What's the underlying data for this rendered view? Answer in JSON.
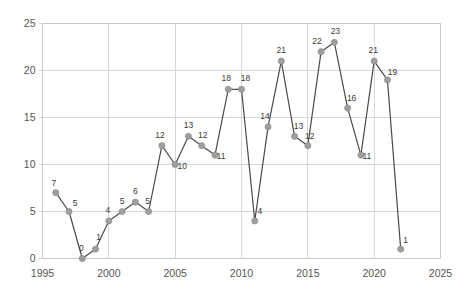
{
  "chart_data": {
    "type": "line",
    "title": "",
    "subtitle": "",
    "xlabel": "",
    "ylabel": "",
    "x": [
      1996,
      1997,
      1998,
      1999,
      2000,
      2001,
      2002,
      2003,
      2004,
      2005,
      2006,
      2007,
      2008,
      2009,
      2010,
      2011,
      2012,
      2013,
      2014,
      2015,
      2016,
      2017,
      2018,
      2019,
      2020,
      2021,
      2022
    ],
    "values": [
      7,
      5,
      0,
      1,
      4,
      5,
      6,
      5,
      12,
      10,
      13,
      12,
      11,
      18,
      18,
      4,
      14,
      21,
      13,
      12,
      22,
      23,
      16,
      11,
      21,
      19,
      1
    ],
    "point_labels": [
      "7",
      "5",
      "0",
      "1",
      "4",
      "5",
      "6",
      "5",
      "12",
      "10",
      "13",
      "12",
      "11",
      "18",
      "18",
      "4",
      "14",
      "21",
      "13",
      "12",
      "22",
      "23",
      "16",
      "11",
      "21",
      "19",
      "1"
    ],
    "xlim": [
      1995,
      2025
    ],
    "ylim": [
      0,
      25
    ],
    "xticks": [
      1995,
      2000,
      2005,
      2010,
      2015,
      2020,
      2025
    ],
    "xtick_labels": [
      "1995",
      "2000",
      "2005",
      "2010",
      "2015",
      "2020",
      "2025"
    ],
    "yticks": [
      0,
      5,
      10,
      15,
      20,
      25
    ],
    "ytick_labels": [
      "0",
      "5",
      "10",
      "15",
      "20",
      "25"
    ],
    "grid": true,
    "legend": null,
    "legend_position": "none",
    "series_name": "",
    "colors": {
      "line": "#4a4a4a",
      "marker": "#9e9e9e",
      "grid": "#d8d8d8",
      "border": "#c9c9c9",
      "tick_text": "#555555",
      "label_text": "#3a3a3a",
      "background": "#ffffff"
    },
    "label_offsets": [
      {
        "dx": -2,
        "dy": -7
      },
      {
        "dx": 6,
        "dy": -6
      },
      {
        "dx": -1,
        "dy": -8
      },
      {
        "dx": 3,
        "dy": -9
      },
      {
        "dx": -1,
        "dy": -8
      },
      {
        "dx": 0,
        "dy": -8
      },
      {
        "dx": 0,
        "dy": -8
      },
      {
        "dx": -1,
        "dy": -8
      },
      {
        "dx": -2,
        "dy": -8
      },
      {
        "dx": 7,
        "dy": 4
      },
      {
        "dx": 0,
        "dy": -8
      },
      {
        "dx": 1,
        "dy": -8
      },
      {
        "dx": 6,
        "dy": 4
      },
      {
        "dx": -2,
        "dy": -8
      },
      {
        "dx": 4,
        "dy": -8
      },
      {
        "dx": 5,
        "dy": -7
      },
      {
        "dx": -3,
        "dy": -8
      },
      {
        "dx": 0,
        "dy": -8
      },
      {
        "dx": 4,
        "dy": -7
      },
      {
        "dx": 2,
        "dy": -7
      },
      {
        "dx": -4,
        "dy": -8
      },
      {
        "dx": 1,
        "dy": -8
      },
      {
        "dx": 4,
        "dy": -7
      },
      {
        "dx": 6,
        "dy": 4
      },
      {
        "dx": -1,
        "dy": -8
      },
      {
        "dx": 5,
        "dy": -5
      },
      {
        "dx": 5,
        "dy": -6
      }
    ]
  }
}
